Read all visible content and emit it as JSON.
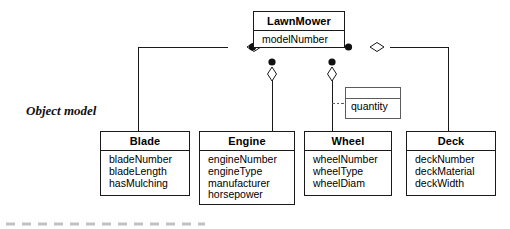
{
  "diagram": {
    "caption": "Object model",
    "line_color": "#1a1a1a",
    "box_border_color": "#1a1a1a",
    "assoc_border_color": "#5c5c5c",
    "background": "#ffffff"
  },
  "classes": {
    "lawnmower": {
      "name": "LawnMower",
      "attributes": [
        "modelNumber"
      ]
    },
    "blade": {
      "name": "Blade",
      "attributes": [
        "bladeNumber",
        "bladeLength",
        "hasMulching"
      ]
    },
    "engine": {
      "name": "Engine",
      "attributes": [
        "engineNumber",
        "engineType",
        "manufacturer",
        "horsepower"
      ]
    },
    "wheel": {
      "name": "Wheel",
      "attributes": [
        "wheelNumber",
        "wheelType",
        "wheelDiam"
      ]
    },
    "deck": {
      "name": "Deck",
      "attributes": [
        "deckNumber",
        "deckMaterial",
        "deckWidth"
      ]
    }
  },
  "association_class": {
    "name": "",
    "attribute": "quantity",
    "attached_to": "wheel"
  },
  "relationships": [
    {
      "from": "lawnmower",
      "to": "blade",
      "type": "aggregation",
      "diamond": "hollow",
      "endpoint": "filled-dot"
    },
    {
      "from": "lawnmower",
      "to": "engine",
      "type": "aggregation",
      "diamond": "hollow",
      "endpoint": "filled-dot"
    },
    {
      "from": "lawnmower",
      "to": "wheel",
      "type": "aggregation",
      "diamond": "hollow",
      "endpoint": "filled-dot"
    },
    {
      "from": "lawnmower",
      "to": "deck",
      "type": "aggregation",
      "diamond": "hollow",
      "endpoint": "filled-dot"
    }
  ]
}
